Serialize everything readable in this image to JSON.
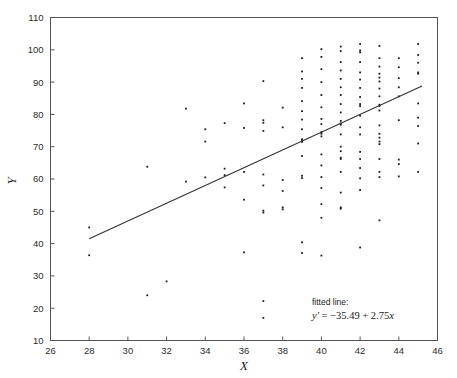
{
  "figure": {
    "background_color": "#ffffff",
    "frame_color": "#555555",
    "point_color": "#1d1d1d",
    "line_color": "#333333"
  },
  "annotation": {
    "label": "fitted line:",
    "equation": "y′ = −35.49 + 2.75x",
    "equation_prefix": "y′",
    "equation_rest": " = −35.49 + 2.75",
    "equation_var": "x"
  },
  "chart_data": {
    "type": "scatter",
    "title": "",
    "xlabel": "X",
    "ylabel": "Y",
    "xlim": [
      26,
      46
    ],
    "ylim": [
      10,
      110
    ],
    "xticks": [
      26,
      28,
      30,
      32,
      34,
      36,
      38,
      40,
      42,
      44,
      46
    ],
    "yticks": [
      10,
      20,
      30,
      40,
      50,
      60,
      70,
      80,
      90,
      100,
      110
    ],
    "grid": false,
    "legend": null,
    "fit_line": {
      "label": "fitted line",
      "equation": "y' = -35.49 + 2.75x",
      "intercept": -35.49,
      "slope": 2.75,
      "x_start": 28.0,
      "x_end": 45.2,
      "y_start": 41.5,
      "y_end": 88.8
    },
    "annotations": [
      {
        "text": "fitted line:",
        "x": 40.6,
        "y": 22.0
      },
      {
        "text": "y' = -35.49 + 2.75x",
        "x": 40.6,
        "y": 18.4
      }
    ],
    "points": [
      [
        28,
        45.0
      ],
      [
        28,
        36.4
      ],
      [
        31,
        63.8
      ],
      [
        31,
        24.0
      ],
      [
        32,
        28.3
      ],
      [
        33,
        81.8
      ],
      [
        33,
        59.2
      ],
      [
        34,
        75.4
      ],
      [
        34,
        71.6
      ],
      [
        34,
        60.5
      ],
      [
        35,
        77.3
      ],
      [
        35,
        63.2
      ],
      [
        35,
        61.2
      ],
      [
        35,
        57.4
      ],
      [
        36,
        83.4
      ],
      [
        36,
        75.8
      ],
      [
        36,
        62.2
      ],
      [
        36,
        53.6
      ],
      [
        36,
        37.3
      ],
      [
        37,
        90.3
      ],
      [
        37,
        78.2
      ],
      [
        37,
        77.4
      ],
      [
        37,
        74.9
      ],
      [
        37,
        61.4
      ],
      [
        37,
        58.0
      ],
      [
        37,
        50.2
      ],
      [
        37,
        49.6
      ],
      [
        37,
        22.2
      ],
      [
        37,
        17.0
      ],
      [
        38,
        82.1
      ],
      [
        38,
        76.0
      ],
      [
        38,
        59.7
      ],
      [
        38,
        56.3
      ],
      [
        38,
        51.2
      ],
      [
        38,
        50.6
      ],
      [
        39,
        97.4
      ],
      [
        39,
        93.3
      ],
      [
        39,
        91.0
      ],
      [
        39,
        88.2
      ],
      [
        39,
        84.1
      ],
      [
        39,
        81.0
      ],
      [
        39,
        78.4
      ],
      [
        39,
        75.4
      ],
      [
        39,
        72.3
      ],
      [
        39,
        71.9
      ],
      [
        39,
        71.5
      ],
      [
        39,
        67.1
      ],
      [
        39,
        61.0
      ],
      [
        39,
        60.3
      ],
      [
        39,
        40.4
      ],
      [
        39,
        37.1
      ],
      [
        40,
        100.2
      ],
      [
        40,
        97.8
      ],
      [
        40,
        94.0
      ],
      [
        40,
        90.0
      ],
      [
        40,
        86.0
      ],
      [
        40,
        82.2
      ],
      [
        40,
        78.6
      ],
      [
        40,
        77.0
      ],
      [
        40,
        74.5
      ],
      [
        40,
        74.0
      ],
      [
        40,
        73.2
      ],
      [
        40,
        67.6
      ],
      [
        40,
        64.2
      ],
      [
        40,
        60.6
      ],
      [
        40,
        57.2
      ],
      [
        40,
        52.2
      ],
      [
        40,
        48.0
      ],
      [
        40,
        36.3
      ],
      [
        41,
        101.0
      ],
      [
        41,
        99.6
      ],
      [
        41,
        96.2
      ],
      [
        41,
        93.6
      ],
      [
        41,
        91.0
      ],
      [
        41,
        88.4
      ],
      [
        41,
        86.0
      ],
      [
        41,
        83.2
      ],
      [
        41,
        80.6
      ],
      [
        41,
        78.0
      ],
      [
        41,
        77.2
      ],
      [
        41,
        76.8
      ],
      [
        41,
        73.8
      ],
      [
        41,
        70.0
      ],
      [
        41,
        68.6
      ],
      [
        41,
        66.6
      ],
      [
        41,
        66.2
      ],
      [
        41,
        62.2
      ],
      [
        41,
        55.8
      ],
      [
        41,
        51.2
      ],
      [
        41,
        50.8
      ],
      [
        42,
        101.8
      ],
      [
        42,
        99.8
      ],
      [
        42,
        99.2
      ],
      [
        42,
        96.2
      ],
      [
        42,
        93.0
      ],
      [
        42,
        90.8
      ],
      [
        42,
        88.2
      ],
      [
        42,
        85.4
      ],
      [
        42,
        83.2
      ],
      [
        42,
        82.6
      ],
      [
        42,
        79.6
      ],
      [
        42,
        76.0
      ],
      [
        42,
        73.8
      ],
      [
        42,
        68.4
      ],
      [
        42,
        66.2
      ],
      [
        42,
        63.4
      ],
      [
        42,
        60.2
      ],
      [
        42,
        56.6
      ],
      [
        42,
        38.8
      ],
      [
        43,
        101.2
      ],
      [
        43,
        97.4
      ],
      [
        43,
        94.8
      ],
      [
        43,
        92.6
      ],
      [
        43,
        91.4
      ],
      [
        43,
        90.2
      ],
      [
        43,
        88.0
      ],
      [
        43,
        85.6
      ],
      [
        43,
        83.0
      ],
      [
        43,
        82.6
      ],
      [
        43,
        81.2
      ],
      [
        43,
        76.6
      ],
      [
        43,
        74.0
      ],
      [
        43,
        72.8
      ],
      [
        43,
        71.6
      ],
      [
        43,
        70.8
      ],
      [
        43,
        66.2
      ],
      [
        43,
        62.2
      ],
      [
        43,
        60.6
      ],
      [
        43,
        47.2
      ],
      [
        44,
        97.4
      ],
      [
        44,
        94.6
      ],
      [
        44,
        91.2
      ],
      [
        44,
        88.4
      ],
      [
        44,
        85.6
      ],
      [
        44,
        78.2
      ],
      [
        44,
        66.0
      ],
      [
        44,
        64.6
      ],
      [
        44,
        60.8
      ],
      [
        45,
        101.8
      ],
      [
        45,
        98.4
      ],
      [
        45,
        96.0
      ],
      [
        45,
        93.0
      ],
      [
        45,
        92.6
      ],
      [
        45,
        83.4
      ],
      [
        45,
        79.0
      ],
      [
        45,
        76.4
      ],
      [
        45,
        71.0
      ],
      [
        45,
        62.2
      ]
    ]
  }
}
